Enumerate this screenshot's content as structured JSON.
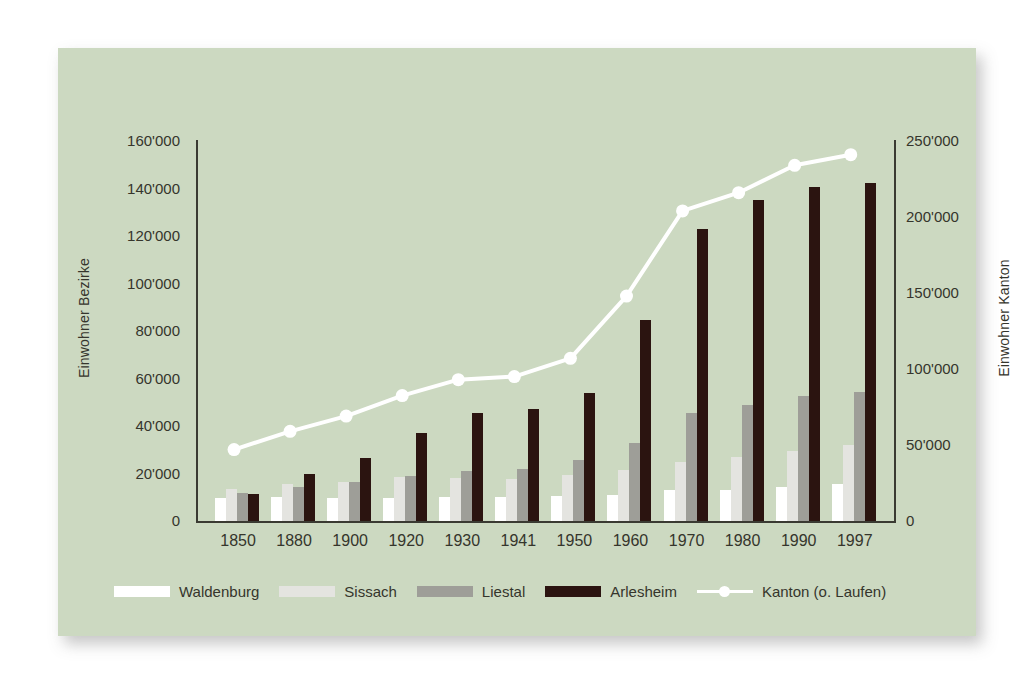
{
  "card": {
    "background_color": "#ccd9c1"
  },
  "chart_data": {
    "type": "bar",
    "title": "",
    "subtitle": "",
    "xlabel": "",
    "ylabel": "Einwohner Bezirke",
    "ylabel_secondary": "Einwohner Kanton",
    "grid": false,
    "legend_position": "bottom",
    "categories": [
      "1850",
      "1880",
      "1900",
      "1920",
      "1930",
      "1941",
      "1950",
      "1960",
      "1970",
      "1980",
      "1990",
      "1997"
    ],
    "ylim": [
      0,
      160000
    ],
    "yticks": [
      0,
      20000,
      40000,
      60000,
      80000,
      100000,
      120000,
      140000,
      160000
    ],
    "ytick_labels": [
      "0",
      "20'000",
      "40'000",
      "60'000",
      "80'000",
      "100'000",
      "120'000",
      "140'000",
      "160'000"
    ],
    "ylim_secondary": [
      0,
      250000
    ],
    "yticks_secondary": [
      0,
      50000,
      100000,
      150000,
      200000,
      250000
    ],
    "ytick_labels_secondary": [
      "0",
      "50'000",
      "100'000",
      "150'000",
      "200'000",
      "250'000"
    ],
    "series": [
      {
        "name": "Waldenburg",
        "kind": "bar",
        "axis": "left",
        "color": "#ffffff",
        "values": [
          9500,
          10000,
          9800,
          9600,
          10000,
          10000,
          10500,
          11000,
          13000,
          13000,
          14500,
          15500
        ]
      },
      {
        "name": "Sissach",
        "kind": "bar",
        "axis": "left",
        "color": "#e4e4e0",
        "values": [
          13500,
          15500,
          16500,
          18500,
          18000,
          17500,
          19500,
          21500,
          25000,
          27000,
          29500,
          32000
        ]
      },
      {
        "name": "Liestal",
        "kind": "bar",
        "axis": "left",
        "color": "#9e9e98",
        "values": [
          12000,
          14500,
          16500,
          19000,
          21000,
          22000,
          25500,
          33000,
          45500,
          49000,
          52500,
          54500
        ]
      },
      {
        "name": "Arlesheim",
        "kind": "bar",
        "axis": "left",
        "color": "#2b1410",
        "values": [
          11500,
          20000,
          26500,
          37000,
          45500,
          47000,
          54000,
          84500,
          123000,
          135000,
          140500,
          142500
        ]
      },
      {
        "name": "Kanton (o. Laufen)",
        "kind": "line",
        "axis": "right",
        "color": "#ffffff",
        "marker": "circle",
        "values": [
          47000,
          59000,
          69000,
          82500,
          93000,
          95000,
          107000,
          148000,
          204000,
          216000,
          234000,
          241000
        ]
      }
    ]
  },
  "legend": {
    "items": [
      {
        "label": "Waldenburg",
        "swatch": "waldenburg"
      },
      {
        "label": "Sissach",
        "swatch": "sissach"
      },
      {
        "label": "Liestal",
        "swatch": "liestal"
      },
      {
        "label": "Arlesheim",
        "swatch": "arlesheim"
      },
      {
        "label": "Kanton (o. Laufen)",
        "swatch": "line"
      }
    ]
  }
}
